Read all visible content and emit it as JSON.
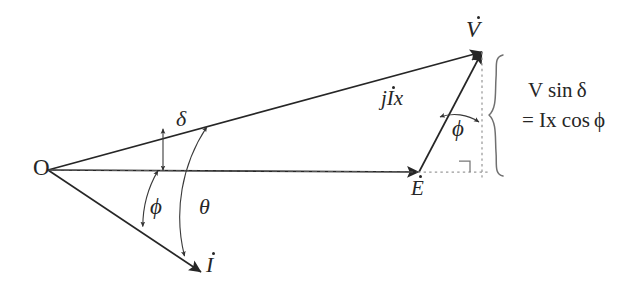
{
  "diagram": {
    "background_color": "#ffffff",
    "stroke_color": "#262626",
    "dashed_color": "#8a8a8a",
    "labels": {
      "origin": "O",
      "voltage_phasor": "V",
      "emf_phasor": "E",
      "current_phasor": "I",
      "reactance_drop": "jIx",
      "reactance_drop_j": "j",
      "reactance_drop_i": "I",
      "reactance_drop_x": "x",
      "angle_delta": "δ",
      "angle_phi_left": "ϕ",
      "angle_theta": "θ",
      "angle_phi_right": "ϕ",
      "brace_line1": "V sin δ",
      "brace_line2": "= Ix cos ϕ"
    },
    "geometry": {
      "origin": {
        "x": 48,
        "y": 170
      },
      "v_tip": {
        "x": 482,
        "y": 52
      },
      "e_tip": {
        "x": 419,
        "y": 172
      },
      "i_tip": {
        "x": 201,
        "y": 272
      },
      "dashed_vertical_x": 482,
      "dashed_vertical_top": 52,
      "dashed_vertical_bottom": 178,
      "dashed_horizontal_from_x": 419,
      "dashed_horizontal_to_x": 487,
      "dashed_horizontal_y": 172,
      "brace_x": 500,
      "brace_top": 53,
      "brace_bottom": 178,
      "right_angle_corner": {
        "x": 470,
        "y": 172
      },
      "right_angle_size": 11,
      "delta_marker_x": 163,
      "delta_marker_top": 129,
      "delta_marker_bottom": 170,
      "phi_arc_radius": 110,
      "theta_arc_radius": 163
    },
    "angles_degrees": {
      "delta": 15,
      "phi": 30,
      "theta": 45
    }
  }
}
